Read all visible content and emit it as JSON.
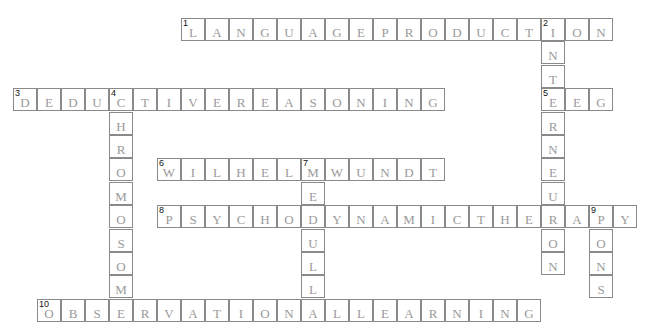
{
  "puzzle": {
    "grid": {
      "origin_x": 13,
      "origin_y": 18,
      "cell_w": 24,
      "cell_h": 23.4
    },
    "entries": [
      {
        "number": 1,
        "direction": "across",
        "row": 0,
        "col": 7,
        "answer": "LANGUAGEPRODUCTION"
      },
      {
        "number": 2,
        "direction": "down",
        "row": 0,
        "col": 22,
        "answer": "INTERNEURON"
      },
      {
        "number": 3,
        "direction": "across",
        "row": 3,
        "col": 0,
        "answer": "DEDUCTIVEREASONING"
      },
      {
        "number": 4,
        "direction": "down",
        "row": 3,
        "col": 4,
        "answer": "CHROMOSOME"
      },
      {
        "number": 5,
        "direction": "across",
        "row": 3,
        "col": 22,
        "answer": "EEG"
      },
      {
        "number": 6,
        "direction": "across",
        "row": 6,
        "col": 6,
        "answer": "WILHELMWUNDT"
      },
      {
        "number": 7,
        "direction": "down",
        "row": 6,
        "col": 12,
        "answer": "MEDULLA"
      },
      {
        "number": 8,
        "direction": "across",
        "row": 8,
        "col": 6,
        "answer": "PSYCHODYNAMICTHERAPY"
      },
      {
        "number": 9,
        "direction": "down",
        "row": 8,
        "col": 24,
        "answer": "PONS"
      },
      {
        "number": 10,
        "direction": "across",
        "row": 12,
        "col": 1,
        "answer": "OBSERVATIONALLEARNING"
      }
    ]
  }
}
